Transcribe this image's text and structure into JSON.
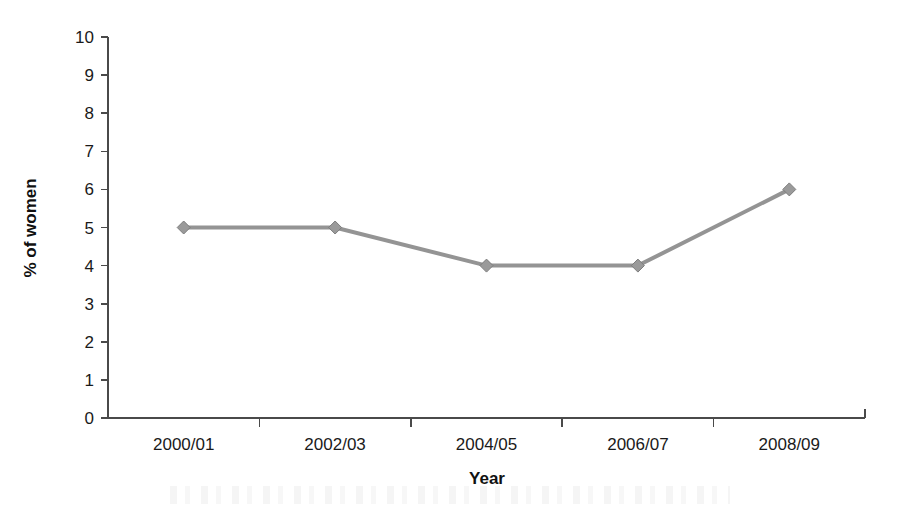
{
  "chart_data": {
    "type": "line",
    "title": "",
    "subtitle": "",
    "xlabel": "Year",
    "ylabel": "% of women",
    "categories": [
      "2000/01",
      "2002/03",
      "2004/05",
      "2006/07",
      "2008/09"
    ],
    "values": [
      5,
      5,
      4,
      4,
      6
    ],
    "series": [
      {
        "name": "% of women",
        "values": [
          5,
          5,
          4,
          4,
          6
        ]
      }
    ],
    "ylim": [
      0,
      10
    ],
    "ytick_labels": [
      "0",
      "1",
      "2",
      "3",
      "4",
      "5",
      "6",
      "7",
      "8",
      "9",
      "10"
    ],
    "ytick_values": [
      0,
      1,
      2,
      3,
      4,
      5,
      6,
      7,
      8,
      9,
      10
    ],
    "grid": false,
    "legend": false,
    "legend_position": "none",
    "marker": "diamond",
    "colors": {
      "line": "#949494",
      "marker_fill": "#9a9a9a",
      "marker_stroke": "#7d7d7d",
      "axis": "#4a4a4a",
      "text": "#1a1a1a",
      "background": "#ffffff"
    }
  }
}
